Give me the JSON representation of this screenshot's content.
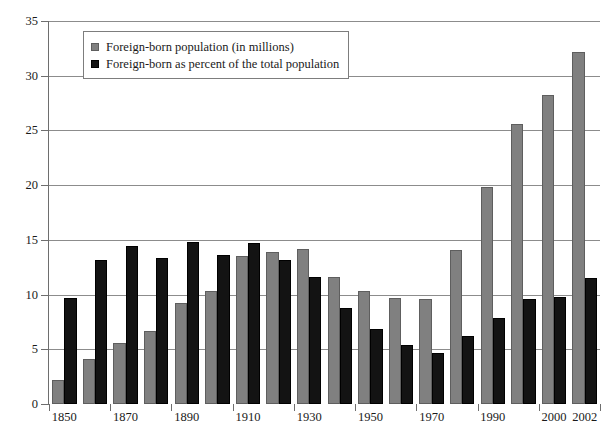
{
  "chart_data": {
    "type": "bar",
    "title": "",
    "xlabel": "",
    "ylabel": "",
    "ylim": [
      0,
      35
    ],
    "yticks": [
      0,
      5,
      10,
      15,
      20,
      25,
      30,
      35
    ],
    "grid": true,
    "legend_position": "top-left",
    "categories": [
      "1850",
      "1860",
      "1870",
      "1880",
      "1890",
      "1900",
      "1910",
      "1920",
      "1930",
      "1940",
      "1950",
      "1960",
      "1970",
      "1980",
      "1990",
      "1995",
      "2000",
      "2002"
    ],
    "tick_labels": [
      "1850",
      "1870",
      "1890",
      "1910",
      "1930",
      "1950",
      "1970",
      "1990",
      "2000",
      "2002"
    ],
    "series": [
      {
        "name": "Foreign-born population (in millions)",
        "color": "#808080",
        "values": [
          2.2,
          4.1,
          5.6,
          6.7,
          9.2,
          10.3,
          13.5,
          13.9,
          14.2,
          11.6,
          10.3,
          9.7,
          9.6,
          14.1,
          19.8,
          25.6,
          28.2,
          32.2
        ]
      },
      {
        "name": "Foreign-born as percent of the total population",
        "color": "#131313",
        "values": [
          9.7,
          13.2,
          14.4,
          13.3,
          14.8,
          13.6,
          14.7,
          13.2,
          11.6,
          8.8,
          6.9,
          5.4,
          4.7,
          6.2,
          7.9,
          9.6,
          9.8,
          11.5
        ]
      }
    ]
  },
  "legend": {
    "items": [
      {
        "label": "Foreign-born population (in millions)",
        "swatch": "gray-square-icon"
      },
      {
        "label": "Foreign-born as percent of the total population",
        "swatch": "black-square-icon"
      }
    ]
  },
  "axes": {
    "y_tick_labels": [
      "0",
      "5",
      "10",
      "15",
      "20",
      "25",
      "30",
      "35"
    ],
    "x_tick_labels": [
      "1850",
      "1870",
      "1890",
      "1910",
      "1930",
      "1950",
      "1970",
      "1990",
      "2000",
      "2002"
    ]
  }
}
